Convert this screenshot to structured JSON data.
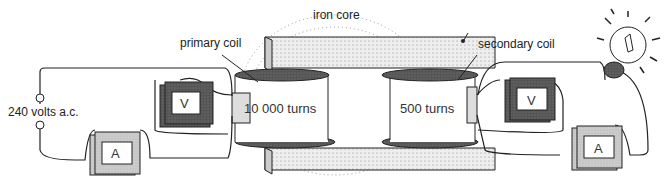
{
  "diagram": {
    "type": "transformer circuit",
    "labels": {
      "iron_core": "iron core",
      "primary_coil": "primary coil",
      "secondary_coil": "secondary coil",
      "primary_turns": "10 000 turns",
      "secondary_turns": "500 turns",
      "supply": "240 volts a.c."
    },
    "meters": {
      "primary_voltmeter": "V",
      "primary_ammeter": "A",
      "secondary_voltmeter": "V",
      "secondary_ammeter": "A"
    },
    "colors": {
      "line": "#222222",
      "dark_meter": "#555555",
      "light_meter": "#cccccc",
      "core_fill": "#e6e6e6"
    }
  }
}
